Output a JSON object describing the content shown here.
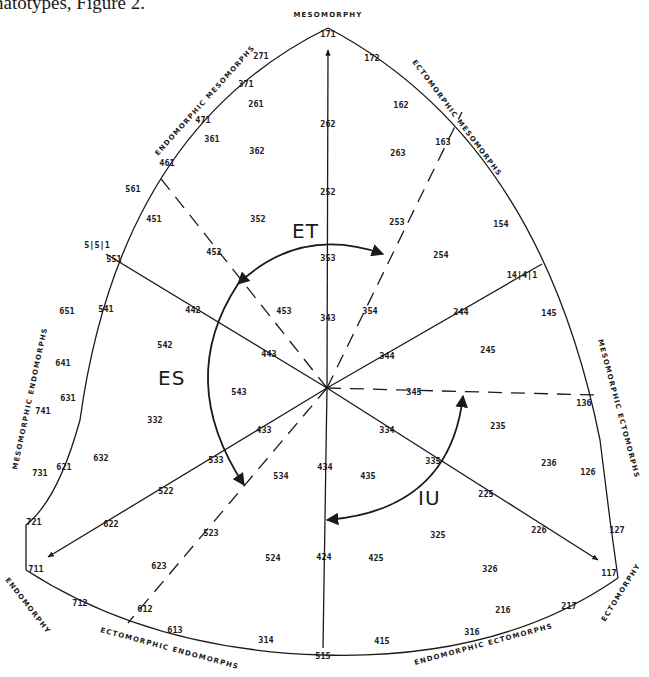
{
  "caption": "natotypes, Figure 2.",
  "colors": {
    "ink": "#1a1a1a",
    "paper": "#ffffff"
  },
  "poles": {
    "mesomorphy": "MESOMORPHY",
    "endomorphy": "ENDOMORPHY",
    "ectomorphy": "ECTOMORPHY"
  },
  "regions": {
    "endomorphic_mesomorphs": "ENDOMORPHIC MESOMORPHS",
    "ectomorphic_mesomorphs": "ECTOMORPHIC MESOMORPHS",
    "mesomorphic_endomorphs": "MESOMORPHIC ENDOMORPHS",
    "mesomorphic_ectomorphs": "MESOMORPHIC ECTOMORPHS",
    "ectomorphic_endomorphs": "ECTOMORPHIC ENDOMORPHS",
    "endomorphic_ectomorphs": "ENDOMORPHIC ECTOMORPHS"
  },
  "arrows": {
    "et": "ET",
    "es": "ES",
    "iu": "IU"
  },
  "somatotypes": [
    {
      "code": "171",
      "x": 328,
      "y": 34
    },
    {
      "code": "271",
      "x": 261,
      "y": 56
    },
    {
      "code": "172",
      "x": 372,
      "y": 58
    },
    {
      "code": "371",
      "x": 246,
      "y": 84
    },
    {
      "code": "261",
      "x": 256,
      "y": 104
    },
    {
      "code": "162",
      "x": 401,
      "y": 105
    },
    {
      "code": "471",
      "x": 203,
      "y": 120
    },
    {
      "code": "361",
      "x": 212,
      "y": 139
    },
    {
      "code": "362",
      "x": 257,
      "y": 151
    },
    {
      "code": "262",
      "x": 328,
      "y": 124
    },
    {
      "code": "263",
      "x": 398,
      "y": 153
    },
    {
      "code": "163",
      "x": 443,
      "y": 142
    },
    {
      "code": "461",
      "x": 167,
      "y": 163
    },
    {
      "code": "561",
      "x": 133,
      "y": 189
    },
    {
      "code": "252",
      "x": 328,
      "y": 192
    },
    {
      "code": "451",
      "x": 154,
      "y": 219
    },
    {
      "code": "352",
      "x": 258,
      "y": 219
    },
    {
      "code": "253",
      "x": 397,
      "y": 222
    },
    {
      "code": "154",
      "x": 501,
      "y": 224
    },
    {
      "code": "452",
      "x": 214,
      "y": 252
    },
    {
      "code": "5|5|1",
      "x": 97,
      "y": 245
    },
    {
      "code": "551",
      "x": 114,
      "y": 259
    },
    {
      "code": "353",
      "x": 328,
      "y": 258
    },
    {
      "code": "254",
      "x": 441,
      "y": 255
    },
    {
      "code": "14|4|1",
      "x": 522,
      "y": 275
    },
    {
      "code": "651",
      "x": 67,
      "y": 311
    },
    {
      "code": "541",
      "x": 106,
      "y": 309
    },
    {
      "code": "442",
      "x": 193,
      "y": 310
    },
    {
      "code": "453",
      "x": 284,
      "y": 311
    },
    {
      "code": "343",
      "x": 328,
      "y": 318
    },
    {
      "code": "354",
      "x": 370,
      "y": 311
    },
    {
      "code": "244",
      "x": 461,
      "y": 312
    },
    {
      "code": "145",
      "x": 549,
      "y": 313
    },
    {
      "code": "542",
      "x": 165,
      "y": 345
    },
    {
      "code": "443",
      "x": 269,
      "y": 354
    },
    {
      "code": "344",
      "x": 387,
      "y": 356
    },
    {
      "code": "245",
      "x": 488,
      "y": 350
    },
    {
      "code": "641",
      "x": 63,
      "y": 363
    },
    {
      "code": "631",
      "x": 68,
      "y": 398
    },
    {
      "code": "543",
      "x": 239,
      "y": 392
    },
    {
      "code": "345",
      "x": 414,
      "y": 392
    },
    {
      "code": "136",
      "x": 584,
      "y": 403
    },
    {
      "code": "741",
      "x": 43,
      "y": 411
    },
    {
      "code": "332",
      "x": 155,
      "y": 420
    },
    {
      "code": "433",
      "x": 264,
      "y": 430
    },
    {
      "code": "334",
      "x": 387,
      "y": 430
    },
    {
      "code": "235",
      "x": 498,
      "y": 426
    },
    {
      "code": "632",
      "x": 101,
      "y": 458
    },
    {
      "code": "621",
      "x": 64,
      "y": 467
    },
    {
      "code": "731",
      "x": 40,
      "y": 473
    },
    {
      "code": "533",
      "x": 216,
      "y": 460
    },
    {
      "code": "534",
      "x": 281,
      "y": 476
    },
    {
      "code": "434",
      "x": 325,
      "y": 467
    },
    {
      "code": "435",
      "x": 368,
      "y": 476
    },
    {
      "code": "335",
      "x": 433,
      "y": 461
    },
    {
      "code": "236",
      "x": 549,
      "y": 463
    },
    {
      "code": "126",
      "x": 588,
      "y": 472
    },
    {
      "code": "522",
      "x": 166,
      "y": 491
    },
    {
      "code": "225",
      "x": 486,
      "y": 494
    },
    {
      "code": "721",
      "x": 34,
      "y": 522
    },
    {
      "code": "622",
      "x": 111,
      "y": 524
    },
    {
      "code": "523",
      "x": 211,
      "y": 533
    },
    {
      "code": "325",
      "x": 438,
      "y": 535
    },
    {
      "code": "226",
      "x": 539,
      "y": 530
    },
    {
      "code": "127",
      "x": 617,
      "y": 530
    },
    {
      "code": "524",
      "x": 273,
      "y": 558
    },
    {
      "code": "424",
      "x": 324,
      "y": 557
    },
    {
      "code": "425",
      "x": 376,
      "y": 558
    },
    {
      "code": "711",
      "x": 36,
      "y": 569
    },
    {
      "code": "623",
      "x": 159,
      "y": 566
    },
    {
      "code": "326",
      "x": 490,
      "y": 569
    },
    {
      "code": "117",
      "x": 609,
      "y": 573
    },
    {
      "code": "712",
      "x": 80,
      "y": 603
    },
    {
      "code": "612",
      "x": 145,
      "y": 609
    },
    {
      "code": "216",
      "x": 503,
      "y": 610
    },
    {
      "code": "217",
      "x": 569,
      "y": 606
    },
    {
      "code": "613",
      "x": 175,
      "y": 630
    },
    {
      "code": "314",
      "x": 266,
      "y": 640
    },
    {
      "code": "316",
      "x": 472,
      "y": 632
    },
    {
      "code": "415",
      "x": 382,
      "y": 641
    },
    {
      "code": "515",
      "x": 323,
      "y": 656
    }
  ]
}
